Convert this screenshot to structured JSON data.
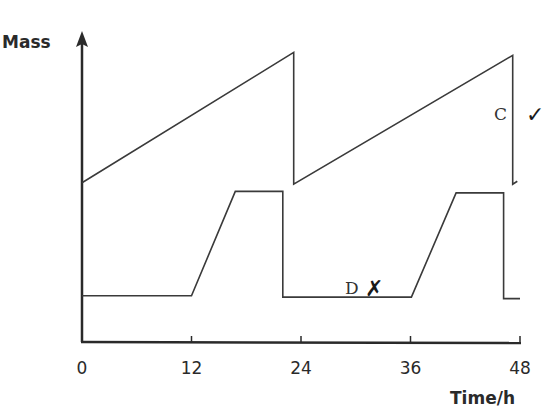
{
  "chart_data": {
    "type": "line",
    "title": "",
    "xlabel": "Time/h",
    "ylabel": "Mass",
    "xlim": [
      0,
      48
    ],
    "x_ticks": [
      0,
      12,
      24,
      36,
      48
    ],
    "x_tick_labels": [
      "0",
      "12",
      "24",
      "36",
      "48"
    ],
    "grid": false,
    "legend": "inline labels",
    "series": [
      {
        "name": "C",
        "annotation": "✓",
        "description": "sawtooth: rises linearly from t=0 to t=23, drops sharply, rises again to t=47, drops",
        "points": [
          [
            0,
            0.55
          ],
          [
            23.2,
            1.0
          ],
          [
            23.2,
            0.545
          ],
          [
            47.2,
            0.99
          ],
          [
            47.2,
            0.545
          ],
          [
            47.7,
            0.555
          ]
        ]
      },
      {
        "name": "D",
        "annotation": "✗",
        "description": "low baseline, ramps up from t=12 to t=17, plateau until t=22, drops; repeats from t=36 to t=46",
        "points": [
          [
            0,
            0.16
          ],
          [
            12,
            0.16
          ],
          [
            16.8,
            0.52
          ],
          [
            22,
            0.52
          ],
          [
            22,
            0.155
          ],
          [
            36.1,
            0.155
          ],
          [
            41,
            0.515
          ],
          [
            46.2,
            0.515
          ],
          [
            46.2,
            0.15
          ],
          [
            48,
            0.15
          ]
        ]
      }
    ]
  },
  "labels": {
    "y_axis": "Mass",
    "x_axis": "Time/h",
    "series_c": "C",
    "series_d": "D",
    "check_mark": "✓",
    "cross_mark": "✗"
  },
  "colors": {
    "axis": "#2a2a2a",
    "line": "#3a3a3a"
  }
}
